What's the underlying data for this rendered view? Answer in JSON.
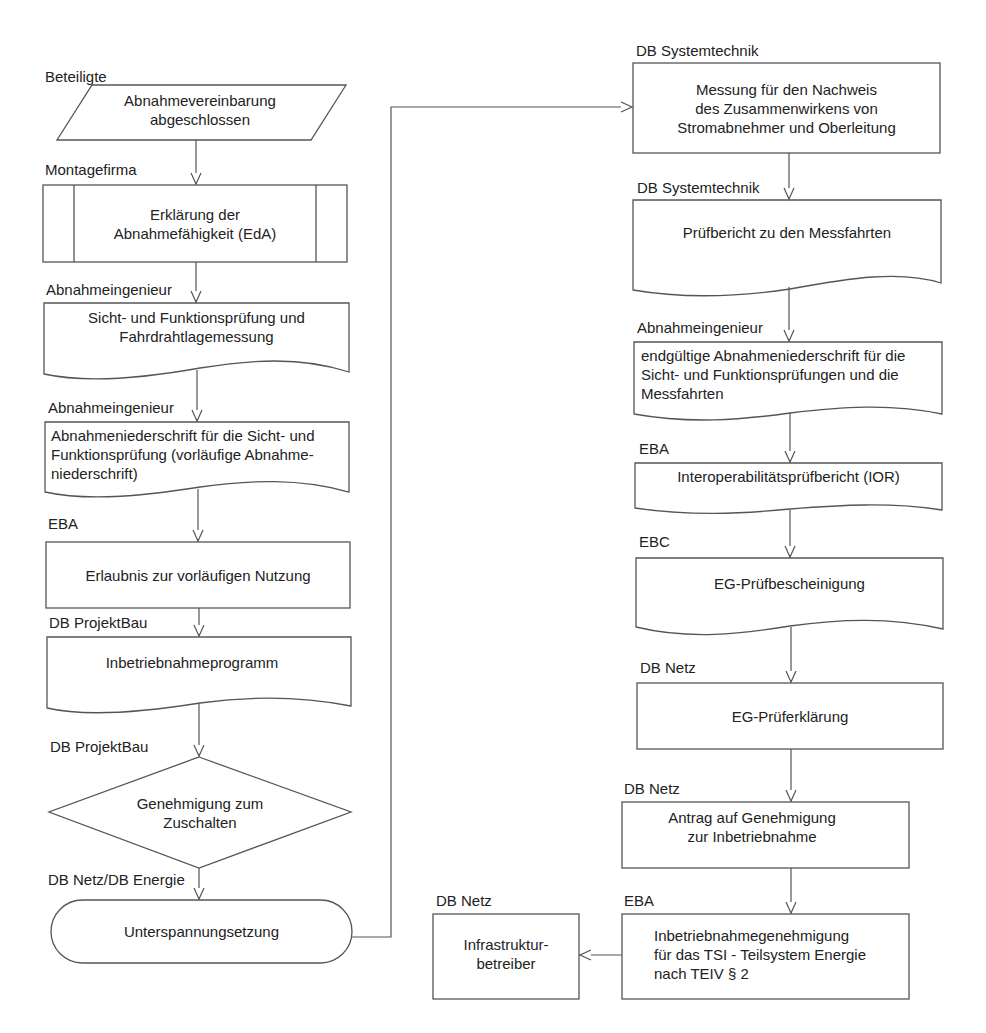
{
  "diagram": {
    "type": "flowchart",
    "language": "de",
    "line_color": "#555555",
    "left_column": [
      {
        "actor": "Beteiligte",
        "shape": "parallelogram",
        "text": "Abnahmevereinbarung\nabgeschlossen"
      },
      {
        "actor": "Montagefirma",
        "shape": "predefined-process",
        "text": "Erklärung der\nAbnahmefähigkeit (EdA)"
      },
      {
        "actor": "Abnahmeingenieur",
        "shape": "document",
        "text": "Sicht- und Funktionsprüfung und\nFahrdrahtlagemessung"
      },
      {
        "actor": "Abnahmeingenieur",
        "shape": "document",
        "text": "Abnahmeniederschrift für die Sicht- und\nFunktionsprüfung (vorläufige Abnahme-\nniederschrift)"
      },
      {
        "actor": "EBA",
        "shape": "process",
        "text": "Erlaubnis zur vorläufigen Nutzung"
      },
      {
        "actor": "DB ProjektBau",
        "shape": "document",
        "text": "Inbetriebnahmeprogramm"
      },
      {
        "actor": "DB ProjektBau",
        "shape": "decision",
        "text": "Genehmigung zum\nZuschalten"
      },
      {
        "actor": "DB Netz/DB Energie",
        "shape": "terminator",
        "text": "Unterspannungsetzung"
      }
    ],
    "right_column": [
      {
        "actor": "DB Systemtechnik",
        "shape": "process",
        "text": "Messung für den Nachweis\ndes Zusammenwirkens von\nStromabnehmer und Oberleitung"
      },
      {
        "actor": "DB Systemtechnik",
        "shape": "document",
        "text": "Prüfbericht zu den Messfahrten"
      },
      {
        "actor": "Abnahmeingenieur",
        "shape": "document",
        "text": "endgültige Abnahmeniederschrift für die\nSicht- und Funktionsprüfungen und die\nMessfahrten"
      },
      {
        "actor": "EBA",
        "shape": "document",
        "text": "Interoperabilitätsprüfbericht (IOR)"
      },
      {
        "actor": "EBC",
        "shape": "document",
        "text": "EG-Prüfbescheinigung"
      },
      {
        "actor": "DB Netz",
        "shape": "process",
        "text": "EG-Prüferklärung"
      },
      {
        "actor": "DB Netz",
        "shape": "process",
        "text": "Antrag auf Genehmigung\nzur Inbetriebnahme"
      },
      {
        "actor": "EBA",
        "shape": "process",
        "text": "Inbetriebnahmegenehmigung\nfür das TSI - Teilsystem Energie\nnach TEIV § 2"
      }
    ],
    "final_node": {
      "actor": "DB Netz",
      "shape": "process",
      "text": "Infrastruktur-\nbetreiber"
    }
  },
  "labels": {
    "l0": "Beteiligte",
    "l1": "Montagefirma",
    "l2": "Abnahmeingenieur",
    "l3": "Abnahmeingenieur",
    "l4": "EBA",
    "l5": "DB ProjektBau",
    "l6": "DB ProjektBau",
    "l7": "DB Netz/DB Energie",
    "r0": "DB Systemtechnik",
    "r1": "DB Systemtechnik",
    "r2": "Abnahmeingenieur",
    "r3": "EBA",
    "r4": "EBC",
    "r5": "DB Netz",
    "r6": "DB Netz",
    "r7": "EBA",
    "f0": "DB Netz"
  },
  "texts": {
    "l0": [
      "Abnahmevereinbarung",
      "abgeschlossen"
    ],
    "l1": [
      "Erklärung der",
      "Abnahmefähigkeit (EdA)"
    ],
    "l2": [
      "Sicht- und Funktionsprüfung und",
      "Fahrdrahtlagemessung"
    ],
    "l3": [
      "Abnahmeniederschrift für die Sicht- und",
      "Funktionsprüfung (vorläufige Abnahme-",
      "niederschrift)"
    ],
    "l4": [
      "Erlaubnis zur vorläufigen Nutzung"
    ],
    "l5": [
      "Inbetriebnahmeprogramm"
    ],
    "l6": [
      "Genehmigung zum",
      "Zuschalten"
    ],
    "l7": [
      "Unterspannungsetzung"
    ],
    "r0": [
      "Messung für den Nachweis",
      "des Zusammenwirkens von",
      "Stromabnehmer und Oberleitung"
    ],
    "r1": [
      "Prüfbericht zu den Messfahrten"
    ],
    "r2": [
      "endgültige Abnahmeniederschrift für die",
      "Sicht- und Funktionsprüfungen und die",
      "Messfahrten"
    ],
    "r3": [
      "Interoperabilitätsprüfbericht (IOR)"
    ],
    "r4": [
      "EG-Prüfbescheinigung"
    ],
    "r5": [
      "EG-Prüferklärung"
    ],
    "r6": [
      "Antrag auf Genehmigung",
      "zur Inbetriebnahme"
    ],
    "r7": [
      "Inbetriebnahmegenehmigung",
      "für das TSI - Teilsystem Energie",
      "nach TEIV § 2"
    ],
    "f0": [
      "Infrastruktur-",
      "betreiber"
    ]
  }
}
